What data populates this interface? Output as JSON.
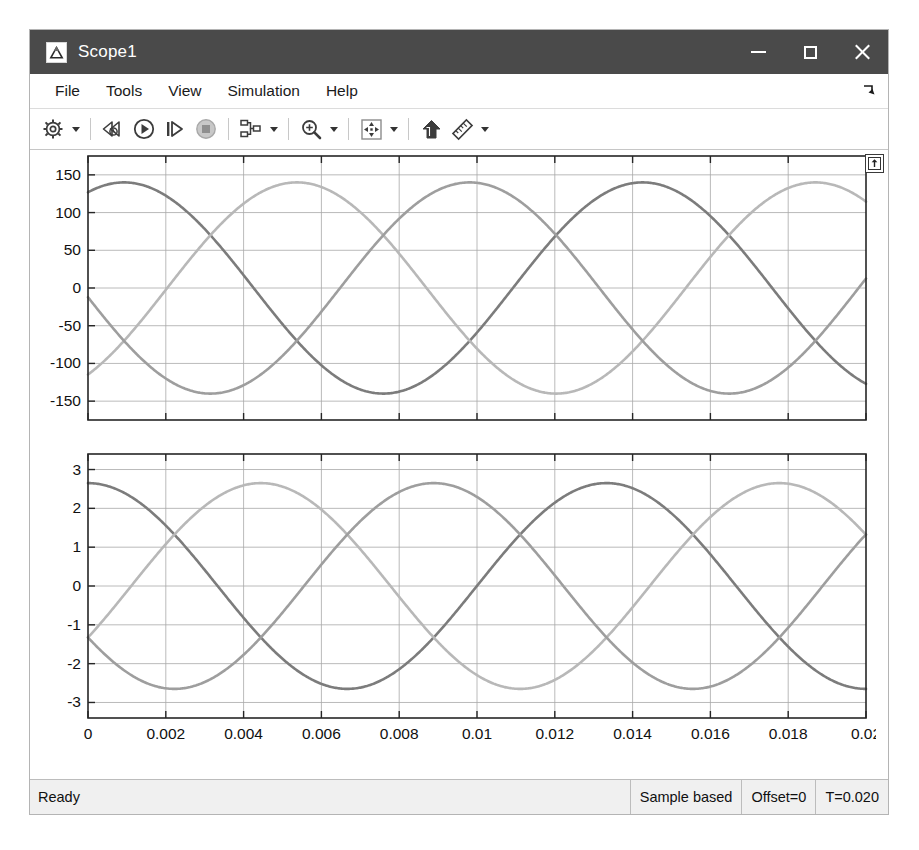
{
  "window": {
    "title": "Scope1",
    "app_icon": "matlab-triangle-icon",
    "controls": {
      "minimize": "minimize-icon",
      "maximize": "maximize-icon",
      "close": "close-icon"
    }
  },
  "menubar": {
    "items": [
      {
        "label": "File",
        "name": "menu-file"
      },
      {
        "label": "Tools",
        "name": "menu-tools"
      },
      {
        "label": "View",
        "name": "menu-view"
      },
      {
        "label": "Simulation",
        "name": "menu-simulation"
      },
      {
        "label": "Help",
        "name": "menu-help"
      }
    ],
    "dock_control": "undock-arrow-icon"
  },
  "toolbar": {
    "buttons": [
      {
        "name": "configuration-properties-button",
        "icon": "gear-icon",
        "has_caret": true
      },
      {
        "name": "restart-simulation-button",
        "icon": "rewind-icon",
        "has_caret": false
      },
      {
        "name": "run-simulation-button",
        "icon": "play-icon",
        "has_caret": false
      },
      {
        "name": "step-forward-button",
        "icon": "step-forward-icon",
        "has_caret": false
      },
      {
        "name": "stop-simulation-button",
        "icon": "stop-icon",
        "has_caret": false
      },
      {
        "name": "signal-selection-button",
        "icon": "signal-layout-icon",
        "has_caret": true
      },
      {
        "name": "zoom-in-button",
        "icon": "zoom-in-icon",
        "has_caret": true
      },
      {
        "name": "fit-to-view-button",
        "icon": "autoscale-icon",
        "has_caret": true
      },
      {
        "name": "go-to-model-button",
        "icon": "jump-to-model-icon",
        "has_caret": false
      },
      {
        "name": "measurements-button",
        "icon": "ruler-icon",
        "has_caret": true
      }
    ]
  },
  "plot_overlay": {
    "maximize_axes": "maximize-axes-icon"
  },
  "statusbar": {
    "ready": "Ready",
    "frame_mode": "Sample based",
    "offset": "Offset=0",
    "time": "T=0.020"
  },
  "colors": {
    "titlebar": "#4a4a4a",
    "series_1": "#7c7c7c",
    "series_2": "#9e9e9e",
    "series_3": "#b8b8b8",
    "grid": "#a8a8a8",
    "axis": "#262626",
    "window_bg": "#f0f0f0"
  },
  "chart_data": [
    {
      "id": "voltage-plot",
      "type": "line",
      "title": "",
      "xlabel": "",
      "ylabel": "",
      "xlim": [
        0,
        0.02
      ],
      "ylim": [
        -175,
        175
      ],
      "xticks": [
        0,
        0.002,
        0.004,
        0.006,
        0.008,
        0.01,
        0.012,
        0.014,
        0.016,
        0.018,
        0.02
      ],
      "xticklabels": [
        "",
        "",
        "",
        "",
        "",
        "",
        "",
        "",
        "",
        "",
        ""
      ],
      "yticks": [
        150,
        100,
        50,
        0,
        -50,
        -100,
        -150
      ],
      "yticklabels": [
        "150",
        "100",
        "50",
        "0",
        "-50",
        "-100",
        "-150"
      ],
      "grid": true,
      "legend": "none",
      "waveform": "three-phase-sine",
      "amplitude": 140,
      "period": 0.01333,
      "series": [
        {
          "name": "Va",
          "color": "#7c7c7c",
          "phase_deg": 65,
          "value_at_t0": 59
        },
        {
          "name": "Vb",
          "color": "#b8b8b8",
          "phase_deg": -55,
          "value_at_t0": -115
        },
        {
          "name": "Vc",
          "color": "#9e9e9e",
          "phase_deg": 185,
          "value_at_t0": -12
        }
      ]
    },
    {
      "id": "current-plot",
      "type": "line",
      "title": "",
      "xlabel": "",
      "ylabel": "",
      "xlim": [
        0,
        0.02
      ],
      "ylim": [
        -3.4,
        3.4
      ],
      "xticks": [
        0,
        0.002,
        0.004,
        0.006,
        0.008,
        0.01,
        0.012,
        0.014,
        0.016,
        0.018,
        0.02
      ],
      "xticklabels": [
        "0",
        "0.002",
        "0.004",
        "0.006",
        "0.008",
        "0.01",
        "0.012",
        "0.014",
        "0.016",
        "0.018",
        "0.02"
      ],
      "yticks": [
        3,
        2,
        1,
        0,
        -1,
        -2,
        -3
      ],
      "yticklabels": [
        "3",
        "2",
        "1",
        "0",
        "-1",
        "-2",
        "-3"
      ],
      "grid": true,
      "legend": "none",
      "waveform": "three-phase-sine",
      "amplitude": 2.65,
      "period": 0.01333,
      "series": [
        {
          "name": "Ia",
          "color": "#7c7c7c",
          "phase_deg": 90,
          "value_at_t0": 2.65
        },
        {
          "name": "Ib",
          "color": "#b8b8b8",
          "phase_deg": -30,
          "value_at_t0": -1.33
        },
        {
          "name": "Ic",
          "color": "#9e9e9e",
          "phase_deg": 210,
          "value_at_t0": -1.33
        }
      ]
    }
  ]
}
